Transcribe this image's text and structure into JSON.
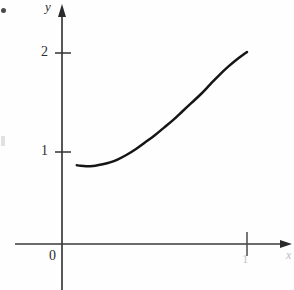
{
  "figure": {
    "background_color": "#fefefe",
    "ink_color": "#1d1d1d",
    "curve_color": "#151515",
    "axis_color": "#3a3a3a"
  },
  "labels": {
    "y_axis_name": "y",
    "x_axis_name": "x",
    "origin": "0",
    "y_tick_2": "2",
    "y_tick_1": "1",
    "x_tick_1": "1"
  },
  "chart_data": {
    "type": "line",
    "title": "",
    "xlabel": "x",
    "ylabel": "y",
    "xlim": [
      -0.25,
      1.24
    ],
    "ylim": [
      -0.5,
      2.55
    ],
    "grid": false,
    "legend": null,
    "x_ticks": [
      0,
      1
    ],
    "x_tick_labels": [
      "0",
      "1"
    ],
    "y_ticks": [
      1,
      2
    ],
    "y_tick_labels": [
      "1",
      "2"
    ],
    "axes_style": "arrowed-axes-through-origin",
    "series": [
      {
        "name": "curve",
        "comment": "convex increasing curve with shallow minimum near x=0.15, rising to (1, 2)",
        "x": [
          0.08,
          0.1,
          0.13,
          0.15,
          0.18,
          0.22,
          0.26,
          0.3,
          0.35,
          0.4,
          0.45,
          0.5,
          0.55,
          0.6,
          0.65,
          0.7,
          0.75,
          0.8,
          0.85,
          0.9,
          0.95,
          1.0
        ],
        "y": [
          0.82,
          0.815,
          0.81,
          0.81,
          0.815,
          0.83,
          0.85,
          0.88,
          0.93,
          0.99,
          1.06,
          1.13,
          1.21,
          1.29,
          1.38,
          1.47,
          1.56,
          1.66,
          1.76,
          1.85,
          1.93,
          2.0
        ]
      }
    ],
    "annotations": []
  }
}
